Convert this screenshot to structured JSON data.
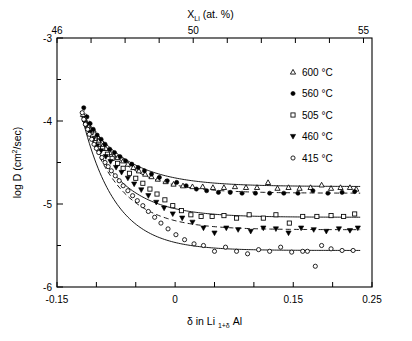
{
  "figure": {
    "title_top_axis": "X",
    "top_axis_label_sub": "Li",
    "top_axis_label_rest": " (at. %)",
    "bottom_axis_label_prefix": "δ in Li ",
    "bottom_axis_label_sub": "1+δ",
    "bottom_axis_label_suffix": " Al",
    "y_axis_label_prefix": "log D (cm",
    "y_axis_label_sup": "2",
    "y_axis_label_suffix": "/sec)"
  },
  "chart_data": {
    "type": "scatter",
    "title": "",
    "xlabel": "δ in Li 1+δ Al",
    "ylabel": "log D (cm2/sec)",
    "top_xlabel": "X_Li (at. %)",
    "xlim": [
      -0.15,
      0.25
    ],
    "ylim": [
      -6,
      -3
    ],
    "top_xlim": [
      46,
      55.25
    ],
    "grid": false,
    "legend_position": "top-right",
    "x_ticks": [
      -0.15,
      -0.1,
      -0.05,
      0,
      0.05,
      0.1,
      0.15,
      0.2,
      0.25
    ],
    "x_tick_labels": [
      "-0.15",
      "",
      "",
      "0",
      "",
      "",
      "0.15",
      "",
      "0.25"
    ],
    "y_ticks": [
      -6,
      -5.5,
      -5,
      -4.5,
      -4,
      -3.5,
      -3
    ],
    "y_tick_labels": [
      "-6",
      "",
      "-5",
      "",
      "-4",
      "",
      "-3"
    ],
    "top_x_ticks": [
      46,
      47,
      48,
      49,
      50,
      51,
      52,
      53,
      54,
      55
    ],
    "top_x_tick_labels": [
      "46",
      "",
      "",
      "",
      "50",
      "",
      "",
      "",
      "",
      "55"
    ],
    "series": [
      {
        "name": "600 °C",
        "marker": "triangle-up-open",
        "linestyle": "solid",
        "fit": {
          "y_plateau": -4.79,
          "y_start": -3.9,
          "x_start": -0.118,
          "decay": 0.055
        },
        "points": [
          [
            -0.117,
            -3.92
          ],
          [
            -0.113,
            -4.02
          ],
          [
            -0.11,
            -4.06
          ],
          [
            -0.106,
            -4.12
          ],
          [
            -0.101,
            -4.2
          ],
          [
            -0.097,
            -4.24
          ],
          [
            -0.092,
            -4.3
          ],
          [
            -0.088,
            -4.33
          ],
          [
            -0.083,
            -4.38
          ],
          [
            -0.078,
            -4.42
          ],
          [
            -0.073,
            -4.44
          ],
          [
            -0.066,
            -4.48
          ],
          [
            -0.06,
            -4.52
          ],
          [
            -0.053,
            -4.56
          ],
          [
            -0.046,
            -4.6
          ],
          [
            -0.038,
            -4.64
          ],
          [
            -0.03,
            -4.67
          ],
          [
            -0.022,
            -4.7
          ],
          [
            -0.012,
            -4.73
          ],
          [
            -0.002,
            -4.76
          ],
          [
            0.01,
            -4.78
          ],
          [
            0.022,
            -4.79
          ],
          [
            0.035,
            -4.79
          ],
          [
            0.048,
            -4.8
          ],
          [
            0.062,
            -4.8
          ],
          [
            0.076,
            -4.79
          ],
          [
            0.09,
            -4.8
          ],
          [
            0.104,
            -4.8
          ],
          [
            0.118,
            -4.74
          ],
          [
            0.13,
            -4.81
          ],
          [
            0.144,
            -4.8
          ],
          [
            0.158,
            -4.81
          ],
          [
            0.172,
            -4.8
          ],
          [
            0.186,
            -4.77
          ],
          [
            0.198,
            -4.81
          ],
          [
            0.21,
            -4.8
          ],
          [
            0.222,
            -4.8
          ],
          [
            0.23,
            -4.82
          ]
        ]
      },
      {
        "name": "560 °C",
        "marker": "circle-filled",
        "linestyle": "dashed",
        "fit": {
          "y_plateau": -4.87,
          "y_start": -3.82,
          "x_start": -0.118,
          "decay": 0.05
        },
        "points": [
          [
            -0.116,
            -3.84
          ],
          [
            -0.112,
            -3.95
          ],
          [
            -0.108,
            -4.03
          ],
          [
            -0.104,
            -4.1
          ],
          [
            -0.099,
            -4.17
          ],
          [
            -0.094,
            -4.22
          ],
          [
            -0.089,
            -4.28
          ],
          [
            -0.083,
            -4.34
          ],
          [
            -0.077,
            -4.38
          ],
          [
            -0.07,
            -4.43
          ],
          [
            -0.063,
            -4.48
          ],
          [
            -0.055,
            -4.52
          ],
          [
            -0.047,
            -4.56
          ],
          [
            -0.039,
            -4.6
          ],
          [
            -0.03,
            -4.64
          ],
          [
            -0.02,
            -4.68
          ],
          [
            -0.01,
            -4.72
          ],
          [
            0.002,
            -4.74
          ],
          [
            0.014,
            -4.78
          ],
          [
            0.027,
            -4.82
          ],
          [
            0.04,
            -4.84
          ],
          [
            0.055,
            -4.86
          ],
          [
            0.07,
            -4.86
          ],
          [
            0.085,
            -4.87
          ],
          [
            0.102,
            -4.87
          ],
          [
            0.12,
            -4.87
          ],
          [
            0.138,
            -4.87
          ],
          [
            0.156,
            -4.87
          ],
          [
            0.175,
            -4.84
          ],
          [
            0.194,
            -4.87
          ],
          [
            0.212,
            -4.86
          ],
          [
            0.228,
            -4.85
          ]
        ]
      },
      {
        "name": "505 °C",
        "marker": "square-open",
        "linestyle": "solid",
        "fit": {
          "y_plateau": -5.16,
          "y_start": -3.95,
          "x_start": -0.118,
          "decay": 0.048
        },
        "points": [
          [
            -0.115,
            -3.98
          ],
          [
            -0.111,
            -4.07
          ],
          [
            -0.107,
            -4.14
          ],
          [
            -0.102,
            -4.21
          ],
          [
            -0.097,
            -4.28
          ],
          [
            -0.092,
            -4.33
          ],
          [
            -0.086,
            -4.4
          ],
          [
            -0.08,
            -4.45
          ],
          [
            -0.073,
            -4.51
          ],
          [
            -0.066,
            -4.57
          ],
          [
            -0.058,
            -4.63
          ],
          [
            -0.05,
            -4.69
          ],
          [
            -0.041,
            -4.75
          ],
          [
            -0.032,
            -4.82
          ],
          [
            -0.023,
            -4.88
          ],
          [
            -0.013,
            -4.95
          ],
          [
            -0.003,
            -5.02
          ],
          [
            0.008,
            -5.08
          ],
          [
            0.02,
            -5.13
          ],
          [
            0.033,
            -5.15
          ],
          [
            0.047,
            -5.15
          ],
          [
            0.062,
            -5.14
          ],
          [
            0.078,
            -5.17
          ],
          [
            0.094,
            -5.13
          ],
          [
            0.112,
            -5.17
          ],
          [
            0.128,
            -5.13
          ],
          [
            0.145,
            -5.23
          ],
          [
            0.162,
            -5.15
          ],
          [
            0.18,
            -5.15
          ],
          [
            0.198,
            -5.14
          ],
          [
            0.214,
            -5.15
          ],
          [
            0.228,
            -5.12
          ]
        ]
      },
      {
        "name": "460 °C",
        "marker": "triangle-down-filled",
        "linestyle": "dashed",
        "fit": {
          "y_plateau": -5.31,
          "y_start": -3.98,
          "x_start": -0.115,
          "decay": 0.046
        },
        "points": [
          [
            -0.112,
            -4.05
          ],
          [
            -0.108,
            -4.14
          ],
          [
            -0.104,
            -4.22
          ],
          [
            -0.099,
            -4.3
          ],
          [
            -0.094,
            -4.36
          ],
          [
            -0.088,
            -4.43
          ],
          [
            -0.082,
            -4.49
          ],
          [
            -0.075,
            -4.56
          ],
          [
            -0.068,
            -4.62
          ],
          [
            -0.06,
            -4.69
          ],
          [
            -0.052,
            -4.76
          ],
          [
            -0.043,
            -4.83
          ],
          [
            -0.034,
            -4.9
          ],
          [
            -0.024,
            -4.98
          ],
          [
            -0.014,
            -5.05
          ],
          [
            -0.003,
            -5.12
          ],
          [
            0.009,
            -5.17
          ],
          [
            0.022,
            -5.22
          ],
          [
            0.036,
            -5.29
          ],
          [
            0.05,
            -5.35
          ],
          [
            0.065,
            -5.29
          ],
          [
            0.08,
            -5.31
          ],
          [
            0.096,
            -5.33
          ],
          [
            0.112,
            -5.29
          ],
          [
            0.128,
            -5.3
          ],
          [
            0.144,
            -5.35
          ],
          [
            0.16,
            -5.29
          ],
          [
            0.176,
            -5.31
          ],
          [
            0.192,
            -5.33
          ],
          [
            0.208,
            -5.3
          ],
          [
            0.222,
            -5.32
          ],
          [
            0.232,
            -5.29
          ]
        ]
      },
      {
        "name": "415 °C",
        "marker": "circle-open",
        "linestyle": "solid",
        "fit": {
          "y_plateau": -5.56,
          "y_start": -3.88,
          "x_start": -0.12,
          "decay": 0.042
        },
        "points": [
          [
            -0.118,
            -3.9
          ],
          [
            -0.116,
            -3.98
          ],
          [
            -0.114,
            -4.04
          ],
          [
            -0.111,
            -4.1
          ],
          [
            -0.109,
            -4.16
          ],
          [
            -0.106,
            -4.22
          ],
          [
            -0.103,
            -4.28
          ],
          [
            -0.1,
            -4.33
          ],
          [
            -0.097,
            -4.38
          ],
          [
            -0.093,
            -4.44
          ],
          [
            -0.089,
            -4.5
          ],
          [
            -0.085,
            -4.55
          ],
          [
            -0.081,
            -4.6
          ],
          [
            -0.076,
            -4.66
          ],
          [
            -0.071,
            -4.72
          ],
          [
            -0.066,
            -4.78
          ],
          [
            -0.06,
            -4.84
          ],
          [
            -0.054,
            -4.9
          ],
          [
            -0.048,
            -4.96
          ],
          [
            -0.041,
            -5.02
          ],
          [
            -0.034,
            -5.09
          ],
          [
            -0.026,
            -5.16
          ],
          [
            -0.018,
            -5.23
          ],
          [
            -0.009,
            -5.3
          ],
          [
            0.001,
            -5.37
          ],
          [
            0.012,
            -5.43
          ],
          [
            0.024,
            -5.48
          ],
          [
            0.036,
            -5.5
          ],
          [
            0.05,
            -5.57
          ],
          [
            0.064,
            -5.52
          ],
          [
            0.078,
            -5.57
          ],
          [
            0.092,
            -5.6
          ],
          [
            0.106,
            -5.55
          ],
          [
            0.12,
            -5.57
          ],
          [
            0.134,
            -5.52
          ],
          [
            0.148,
            -5.58
          ],
          [
            0.162,
            -5.57
          ],
          [
            0.168,
            -5.57
          ],
          [
            0.178,
            -5.75
          ],
          [
            0.186,
            -5.5
          ],
          [
            0.198,
            -5.54
          ],
          [
            0.212,
            -5.56
          ],
          [
            0.226,
            -5.56
          ]
        ]
      }
    ]
  },
  "legend": {
    "items": [
      {
        "label": "600 °C",
        "marker": "triangle-up-open"
      },
      {
        "label": "560 °C",
        "marker": "circle-filled"
      },
      {
        "label": "505 °C",
        "marker": "square-open"
      },
      {
        "label": "460 °C",
        "marker": "triangle-down-filled"
      },
      {
        "label": "415 °C",
        "marker": "circle-open"
      }
    ]
  },
  "colors": {
    "ink": "#000000",
    "background": "#ffffff"
  }
}
